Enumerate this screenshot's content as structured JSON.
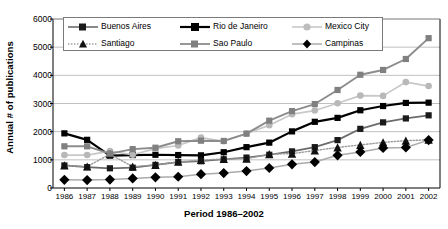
{
  "chart_data": {
    "type": "line",
    "title": "",
    "xlabel": "Period 1986–2002",
    "ylabel": "Annual # of publications",
    "categories": [
      "1986",
      "1987",
      "1988",
      "1989",
      "1990",
      "1991",
      "1992",
      "1993",
      "1994",
      "1995",
      "1996",
      "1997",
      "1998",
      "1999",
      "2000",
      "2001",
      "2002"
    ],
    "x": [
      1986,
      1987,
      1988,
      1989,
      1990,
      1991,
      1992,
      1993,
      1994,
      1995,
      1996,
      1997,
      1998,
      1999,
      2000,
      2001,
      2002
    ],
    "ylim": [
      0,
      6000
    ],
    "yticks": [
      0,
      1000,
      2000,
      3000,
      4000,
      5000,
      6000
    ],
    "ytick_labels": [
      "0",
      "1000",
      "2000",
      "3000",
      "4000",
      "5000",
      "6000"
    ],
    "grid": "horizontal",
    "legend_position": "top-inside",
    "series": [
      {
        "name": "Buenos Aires",
        "marker": "square",
        "color": "#6b6b6b",
        "marker_color": "#1a1a1a",
        "line_style": "solid",
        "values": [
          800,
          740,
          700,
          720,
          820,
          920,
          950,
          1020,
          1080,
          1180,
          1300,
          1450,
          1700,
          2100,
          2330,
          2470,
          2580
        ]
      },
      {
        "name": "Rio de Janeiro",
        "marker": "square",
        "color": "#000000",
        "marker_color": "#000000",
        "line_style": "solid",
        "values": [
          1940,
          1710,
          1150,
          1170,
          1180,
          1170,
          1160,
          1270,
          1450,
          1610,
          2010,
          2350,
          2490,
          2760,
          2910,
          3020,
          3030
        ]
      },
      {
        "name": "Mexico City",
        "marker": "circle",
        "color": "#c8c8c8",
        "marker_color": "#b8b8b8",
        "line_style": "solid",
        "values": [
          1170,
          1170,
          1310,
          1180,
          1400,
          1510,
          1790,
          1660,
          1930,
          2230,
          2620,
          2750,
          3010,
          3280,
          3270,
          3760,
          3620
        ]
      },
      {
        "name": "Santiago",
        "marker": "triangle",
        "color": "#9a9a9a",
        "marker_color": "#111111",
        "line_style": "dotted",
        "values": [
          800,
          760,
          1200,
          760,
          820,
          930,
          990,
          1030,
          1040,
          1200,
          1220,
          1330,
          1440,
          1530,
          1620,
          1680,
          1710
        ]
      },
      {
        "name": "Sao Paulo",
        "marker": "square",
        "color": "#8c8c8c",
        "marker_color": "#808080",
        "line_style": "solid",
        "values": [
          1480,
          1480,
          1220,
          1380,
          1430,
          1660,
          1680,
          1670,
          1930,
          2390,
          2730,
          2980,
          3480,
          4020,
          4190,
          4580,
          5320
        ]
      },
      {
        "name": "Campinas",
        "marker": "diamond",
        "color": "#aaaaaa",
        "marker_color": "#000000",
        "line_style": "solid",
        "values": [
          290,
          280,
          300,
          340,
          380,
          400,
          490,
          530,
          600,
          710,
          840,
          920,
          1160,
          1280,
          1420,
          1440,
          1700
        ]
      }
    ]
  },
  "legend": {
    "items": [
      {
        "label": "Buenos Aires"
      },
      {
        "label": "Rio de Janeiro"
      },
      {
        "label": "Mexico City"
      },
      {
        "label": "Santiago"
      },
      {
        "label": "Sao Paulo"
      },
      {
        "label": "Campinas"
      }
    ]
  }
}
